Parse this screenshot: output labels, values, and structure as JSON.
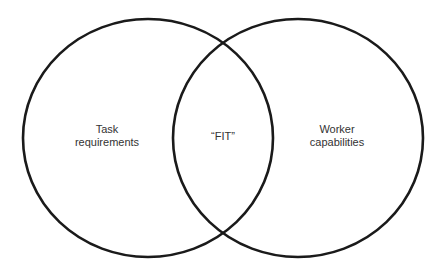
{
  "diagram": {
    "type": "venn",
    "sets": [
      {
        "name": "task-requirements",
        "label_line1": "Task",
        "label_line2": "requirements"
      },
      {
        "name": "worker-capabilities",
        "label_line1": "Worker",
        "label_line2": "capabilities"
      }
    ],
    "intersection": {
      "label": "“FIT”"
    },
    "colors": {
      "stroke": "#1a1a1a",
      "text": "#333333",
      "background": "#ffffff"
    }
  }
}
